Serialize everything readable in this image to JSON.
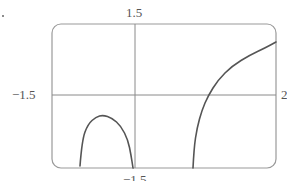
{
  "chart_data": {
    "type": "line",
    "title": "",
    "xlabel": "",
    "ylabel": "",
    "axis_labels": {
      "top": "1.5",
      "left": "−1.5",
      "bottom": "−1.5",
      "right": "2"
    },
    "xlim": [
      -1.5,
      2
    ],
    "ylim": [
      -1.5,
      1.5
    ],
    "grid": false,
    "legend": null,
    "frame": "rounded rectangle",
    "series": [
      {
        "name": "branch-1 (arch)",
        "description": "Closed arch rising from the bottom edge to a peak below the horizontal axis, returning to the bottom edge at the vertical axis",
        "points_px": [
          [
            80,
            166
          ],
          [
            82,
            140
          ],
          [
            88,
            124
          ],
          [
            96,
            117
          ],
          [
            103,
            115
          ],
          [
            112,
            118
          ],
          [
            121,
            126
          ],
          [
            128,
            140
          ],
          [
            131,
            155
          ],
          [
            133,
            168
          ]
        ]
      },
      {
        "name": "branch-2 (increasing)",
        "description": "Curve rising steeply from the bottom edge, crossing the horizontal axis and continuing up to the right edge",
        "points_px": [
          [
            193,
            168
          ],
          [
            194,
            148
          ],
          [
            197,
            128
          ],
          [
            202,
            110
          ],
          [
            208,
            96
          ],
          [
            218,
            80
          ],
          [
            232,
            66
          ],
          [
            250,
            55
          ],
          [
            265,
            48
          ],
          [
            276,
            42
          ]
        ]
      }
    ],
    "colors": {
      "curve": "#555555",
      "axes": "#888888",
      "frame": "#999999"
    }
  }
}
